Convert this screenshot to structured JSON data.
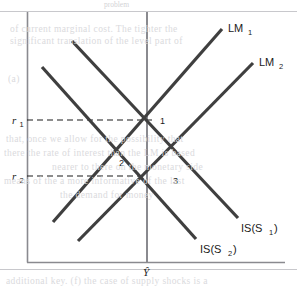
{
  "figure": {
    "background_color": "#ffffff",
    "curve_color": "#3f3f3f",
    "axis_color": "#8a8a8f",
    "text_color": "#1a1a1a",
    "frame": {
      "left": 27,
      "top": 12,
      "right": 285,
      "bottom": 262
    },
    "axes": {
      "y_axis_label": "",
      "x_axis_label": "Ŷ",
      "y_ticks": [
        {
          "label": "r",
          "sub": "1",
          "y": 120
        },
        {
          "label": "r",
          "sub": "2",
          "y": 176
        }
      ]
    },
    "curves": [
      {
        "name": "LM1",
        "label": "LM",
        "sublabel": "1",
        "label_x": 228,
        "label_y": 32,
        "x1": 53,
        "y1": 222,
        "x2": 222,
        "y2": 29
      },
      {
        "name": "LM2",
        "label": "LM",
        "sublabel": "2",
        "label_x": 259,
        "label_y": 66,
        "x1": 78,
        "y1": 241,
        "x2": 253,
        "y2": 63
      },
      {
        "name": "IS_S1",
        "label": "IS(S",
        "sublabel": "1",
        "label_suffix": ")",
        "label_x": 241,
        "label_y": 232,
        "x1": 72,
        "y1": 41,
        "x2": 238,
        "y2": 218
      },
      {
        "name": "IS_S2",
        "label": "IS(S",
        "sublabel": "2",
        "label_suffix": ")",
        "label_x": 200,
        "label_y": 253,
        "x1": 42,
        "y1": 67,
        "x2": 196,
        "y2": 239
      }
    ],
    "vertical_line": {
      "name": "potential-output-line",
      "x": 147,
      "y_top": 12,
      "y_bottom": 262
    },
    "dashed_guides": [
      {
        "name": "r1-guide",
        "x1": 27,
        "y1": 120,
        "x2": 152,
        "y2": 120
      },
      {
        "name": "r2-guide",
        "x1": 27,
        "y1": 176,
        "x2": 147,
        "y2": 176
      }
    ],
    "equilibrium_points": [
      {
        "label": "1",
        "x": 163,
        "y": 121
      },
      {
        "label": "2",
        "x": 122,
        "y": 163
      },
      {
        "label": "3",
        "x": 176,
        "y": 181
      }
    ]
  },
  "bleed_through": {
    "top_caption": "problem",
    "lines": [
      {
        "text": "of current marginal cost. The tighter the",
        "x": 10,
        "y": 30
      },
      {
        "text": "significant translation of the level part of",
        "x": 10,
        "y": 42
      },
      {
        "text": "(a)",
        "x": 8,
        "y": 80
      },
      {
        "text": "that, once we allow for the possibility that",
        "x": 6,
        "y": 140
      },
      {
        "text": "there the rate of interest than the LM is based",
        "x": 4,
        "y": 154
      },
      {
        "text": "nearer to there on the monetary side",
        "x": 52,
        "y": 168
      },
      {
        "text": "means of the a more informative of the last",
        "x": 4,
        "y": 182
      },
      {
        "text": "the demand for money",
        "x": 60,
        "y": 196
      },
      {
        "text": "additional key. (f) the case of supply shocks is a",
        "x": 6,
        "y": 282
      }
    ]
  }
}
